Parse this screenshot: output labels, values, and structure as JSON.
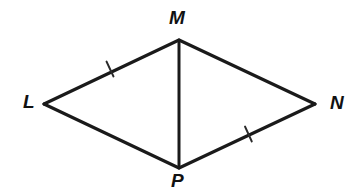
{
  "figure": {
    "kind": "geometry-diagram",
    "background_color": "#ffffff",
    "stroke_color": "#1a1a1a",
    "label_color": "#111111",
    "width": 362,
    "height": 195,
    "labels": {
      "m": "M",
      "l": "L",
      "n": "N",
      "p": "P"
    },
    "vertices": [
      {
        "name": "M",
        "x": 179,
        "y": 40
      },
      {
        "name": "L",
        "x": 44,
        "y": 104
      },
      {
        "name": "N",
        "x": 315,
        "y": 104
      },
      {
        "name": "P",
        "x": 179,
        "y": 168
      }
    ],
    "segments": [
      {
        "name": "LM",
        "from": "L",
        "to": "M",
        "ticks": 1
      },
      {
        "name": "MN",
        "from": "M",
        "to": "N",
        "ticks": 0
      },
      {
        "name": "NP",
        "from": "N",
        "to": "P",
        "ticks": 1
      },
      {
        "name": "PL",
        "from": "P",
        "to": "L",
        "ticks": 0
      },
      {
        "name": "MP",
        "from": "M",
        "to": "P",
        "ticks": 0,
        "role": "diagonal"
      }
    ],
    "tick_marks": [
      {
        "on_segment": "LM",
        "x": 110,
        "y": 69
      },
      {
        "on_segment": "NP",
        "x": 248,
        "y": 134
      }
    ]
  }
}
